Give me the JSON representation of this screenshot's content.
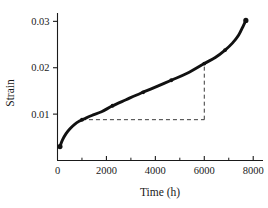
{
  "chart_data": {
    "type": "line",
    "title": "",
    "xlabel": "Time (h)",
    "ylabel": "Strain",
    "xlim": [
      0,
      8400
    ],
    "ylim": [
      0,
      0.0318
    ],
    "grid": false,
    "legend": null,
    "x_ticks": [
      0,
      2000,
      4000,
      6000,
      8000
    ],
    "x_tick_labels": [
      "0",
      "2000",
      "4000",
      "6000",
      "8000"
    ],
    "x_minor_ticks": [
      1000,
      3000,
      5000,
      7000
    ],
    "y_ticks": [
      0.01,
      0.02,
      0.03
    ],
    "y_tick_labels": [
      "0.01",
      "0.02",
      "0.03"
    ],
    "series": [
      {
        "name": "creep-strain",
        "x": [
          100,
          200,
          350,
          520,
          700,
          900,
          1100,
          1400,
          1800,
          2250,
          2800,
          3400,
          3950,
          4650,
          5300,
          6000,
          6450,
          6850,
          7150,
          7400,
          7600,
          7700
        ],
        "y": [
          0.003,
          0.0044,
          0.0058,
          0.0069,
          0.0078,
          0.0085,
          0.009,
          0.0097,
          0.0105,
          0.0118,
          0.0131,
          0.0145,
          0.0157,
          0.0173,
          0.0188,
          0.0209,
          0.0222,
          0.0238,
          0.0253,
          0.027,
          0.0291,
          0.0302
        ]
      }
    ],
    "markers": {
      "x": [
        100,
        1000,
        2250,
        3500,
        4650,
        6000,
        6850,
        7700
      ],
      "y": [
        0.003,
        0.0088,
        0.0118,
        0.0147,
        0.0173,
        0.0209,
        0.0238,
        0.0302
      ]
    },
    "annotations": {
      "slope_triangle": {
        "name": "steady-state-creep-rate-construction",
        "x_start": 1000,
        "x_end": 6000,
        "y_base": 0.0088,
        "y_top": 0.0209
      }
    },
    "colors": {
      "curve": "#111111",
      "axis": "#1a1a1a",
      "dashed": "#3a3a3a",
      "background": "#ffffff"
    }
  }
}
